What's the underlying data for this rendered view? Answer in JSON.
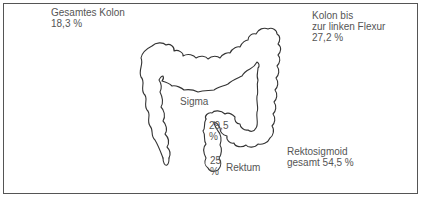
{
  "figure": {
    "type": "anatomical-diagram",
    "labels": {
      "total_colon": {
        "title": "Gesamtes Kolon",
        "value": "18,3 %"
      },
      "left_flexure": {
        "line1": "Kolon bis",
        "line2": "zur linken Flexur",
        "value": "27,2 %"
      },
      "sigma": {
        "title": "Sigma"
      },
      "sigma_value": {
        "number": "29,5",
        "unit": "%"
      },
      "rectum_value": {
        "number": "25",
        "unit": "%"
      },
      "rectum": {
        "title": "Rektum"
      },
      "rectosigmoid": {
        "line1": "Rektosigmoid",
        "line2": "gesamt 54,5 %"
      }
    },
    "colors": {
      "outline": "#333333",
      "text": "#555555",
      "border": "#555555",
      "background": "#ffffff"
    }
  }
}
